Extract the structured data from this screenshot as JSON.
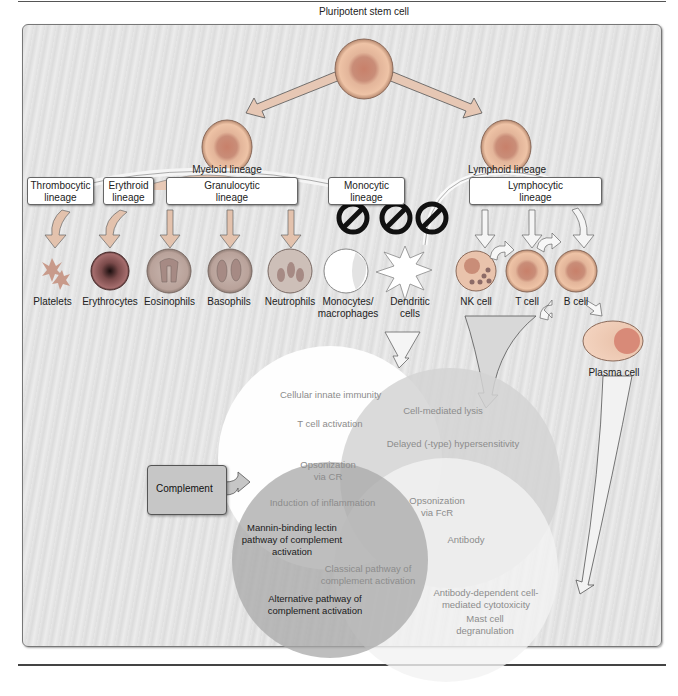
{
  "stem": {
    "label": "Pluripotent stem cell"
  },
  "progenitors": [
    {
      "id": "myeloid",
      "label": "Myeloid lineage"
    },
    {
      "id": "lymphoid",
      "label": "Lymphoid lineage"
    }
  ],
  "lineage_boxes": [
    {
      "id": "thrombocytic",
      "line1": "Thrombocytic",
      "line2": "lineage"
    },
    {
      "id": "erythroid",
      "line1": "Erythroid",
      "line2": "lineage"
    },
    {
      "id": "granulocytic",
      "line1": "Granulocytic",
      "line2": "lineage"
    },
    {
      "id": "monocytic",
      "line1": "Monocytic",
      "line2": "lineage"
    },
    {
      "id": "lymphocytic",
      "line1": "Lymphocytic",
      "line2": "lineage"
    }
  ],
  "cells": [
    {
      "id": "platelets",
      "line1": "Platelets",
      "line2": ""
    },
    {
      "id": "erythrocytes",
      "line1": "Erythrocytes",
      "line2": ""
    },
    {
      "id": "eosinophils",
      "line1": "Eosinophils",
      "line2": ""
    },
    {
      "id": "basophils",
      "line1": "Basophils",
      "line2": ""
    },
    {
      "id": "neutrophils",
      "line1": "Neutrophils",
      "line2": ""
    },
    {
      "id": "monocytes",
      "line1": "Monocytes/",
      "line2": "macrophages"
    },
    {
      "id": "dendritic",
      "line1": "Dendritic",
      "line2": "cells"
    },
    {
      "id": "nk",
      "line1": "NK cell",
      "line2": ""
    },
    {
      "id": "tcell",
      "line1": "T cell",
      "line2": ""
    },
    {
      "id": "bcell",
      "line1": "B cell",
      "line2": ""
    },
    {
      "id": "plasma",
      "line1": "Plasma cell",
      "line2": ""
    }
  ],
  "complement": {
    "label": "Complement"
  },
  "venn": {
    "innate_cellular": [
      "Cellular innate immunity",
      "T cell activation"
    ],
    "cell_mediated": [
      "Cell-mediated lysis",
      "Delayed (-type) hypersensitivity"
    ],
    "complement_region": {
      "opsonization_cr": [
        "Opsonization",
        "via CR"
      ],
      "inflammation": "Induction of inflammation",
      "mannin": [
        "Mannin-binding lectin",
        "pathway of complement",
        "activation"
      ],
      "alternative": [
        "Alternative pathway of",
        "complement activation"
      ]
    },
    "opsonization_fcr": [
      "Opsonization",
      "via FcR"
    ],
    "antibody": "Antibody",
    "classical": [
      "Classical pathway of",
      "complement activation"
    ],
    "adcc": [
      "Antibody-dependent cell-",
      "mediated cytotoxicity"
    ],
    "mast": [
      "Mast cell",
      "degranulation"
    ]
  },
  "colors": {
    "panel_bg": "#e4e4e4",
    "cell_membrane": "#d9a88a",
    "cell_nucleus": "#b77f6b",
    "venn_white": "#ffffff",
    "venn_mid": "#cfcfcf",
    "venn_dark": "#a9a9a9",
    "block_icon": "#111111"
  }
}
